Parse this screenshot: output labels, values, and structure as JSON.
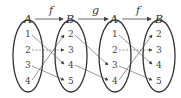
{
  "diagram": {
    "sets": [
      {
        "label": "A",
        "cx": 28,
        "elements": [
          "1",
          "2",
          "3",
          "4"
        ]
      },
      {
        "label": "B",
        "cx": 71,
        "elements": [
          "2",
          "3",
          "4",
          "5"
        ]
      },
      {
        "label": "A",
        "cx": 115,
        "elements": [
          "1",
          "2",
          "3",
          "4"
        ]
      },
      {
        "label": "B",
        "cx": 159,
        "elements": [
          "2",
          "3",
          "4",
          "5"
        ]
      }
    ],
    "maps": [
      {
        "label": "f",
        "from": 0,
        "to": 1
      },
      {
        "label": "g",
        "from": 1,
        "to": 2
      },
      {
        "label": "f",
        "from": 2,
        "to": 3
      }
    ],
    "f_mapping": [
      {
        "from": "1",
        "to": "4",
        "dashed": false
      },
      {
        "from": "2",
        "to": "3",
        "dashed": true
      },
      {
        "from": "3",
        "to": "5",
        "dashed": false
      },
      {
        "from": "4",
        "to": "2",
        "dashed": false
      }
    ],
    "g_mapping": [
      {
        "from": "2",
        "to": "3"
      },
      {
        "from": "4",
        "to": "4"
      }
    ]
  }
}
